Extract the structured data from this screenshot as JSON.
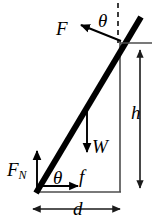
{
  "figure": {
    "type": "free-body-diagram",
    "width": 162,
    "height": 220,
    "background_color": "#ffffff",
    "stroke_color": "#000000",
    "thin_stroke_color": "#4d4d4d"
  },
  "labels": {
    "applied_force": "F",
    "angle_top": "θ",
    "angle_bottom": "θ",
    "weight": "W",
    "friction": "f",
    "normal_force_symbol": "F",
    "normal_force_subscript": "N",
    "height": "h",
    "distance": "d"
  },
  "geometry": {
    "rod": {
      "x1": 36,
      "y1": 193,
      "x2": 141,
      "y2": 17,
      "thickness": 6
    },
    "contact_point": {
      "x": 120,
      "y": 40
    },
    "base_point": {
      "x": 36,
      "y": 193
    },
    "baseline": {
      "x1": 36,
      "y1": 192,
      "x2": 121,
      "y2": 192
    },
    "vertical_leg": {
      "x1": 120,
      "y1": 40,
      "x2": 120,
      "y2": 192
    },
    "dashed_vertical": {
      "x": 118,
      "y1": 3,
      "y2": 42
    },
    "height_dimension": {
      "x": 140,
      "y1": 43,
      "y2": 190
    },
    "distance_dimension": {
      "y": 209,
      "x1": 31,
      "x2": 122
    },
    "force_F_arrow": {
      "x1": 120,
      "y1": 40,
      "x2": 78,
      "y2": 24
    },
    "weight_arrow": {
      "x": 87,
      "y1": 108,
      "y2": 153
    },
    "friction_arrow": {
      "x1": 40,
      "y": 186,
      "x2": 79
    },
    "normal_arrow": {
      "x": 37,
      "y1": 191,
      "y2": 150
    }
  }
}
